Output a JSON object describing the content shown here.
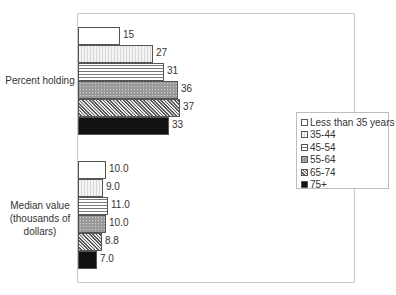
{
  "chart_data": {
    "type": "bar",
    "orientation": "horizontal",
    "title": "",
    "xlabel": "",
    "ylabel": "",
    "grid": false,
    "legend_position": "right",
    "categories": [
      "Percent holding",
      "Median value (thousands of dollars)"
    ],
    "series": [
      {
        "name": "Less than 35 years",
        "values": [
          15,
          10.0
        ],
        "labels": [
          "15",
          "10.0"
        ]
      },
      {
        "name": "35-44",
        "values": [
          27,
          9.0
        ],
        "labels": [
          "27",
          "9.0"
        ]
      },
      {
        "name": "45-54",
        "values": [
          31,
          11.0
        ],
        "labels": [
          "31",
          "11.0"
        ]
      },
      {
        "name": "55-64",
        "values": [
          36,
          10.0
        ],
        "labels": [
          "36",
          "10.0"
        ]
      },
      {
        "name": "65-74",
        "values": [
          37,
          8.8
        ],
        "labels": [
          "37",
          "8.8"
        ]
      },
      {
        "name": "75+",
        "values": [
          33,
          7.0
        ],
        "labels": [
          "33",
          "7.0"
        ]
      }
    ]
  },
  "labels": {
    "group1": "Percent holding",
    "group2_line1": "Median value",
    "group2_line2": "(thousands of",
    "group2_line3": "dollars)"
  },
  "legend": {
    "items": [
      "Less than 35 years",
      "35-44",
      "45-54",
      "55-64",
      "65-74",
      "75+"
    ]
  }
}
